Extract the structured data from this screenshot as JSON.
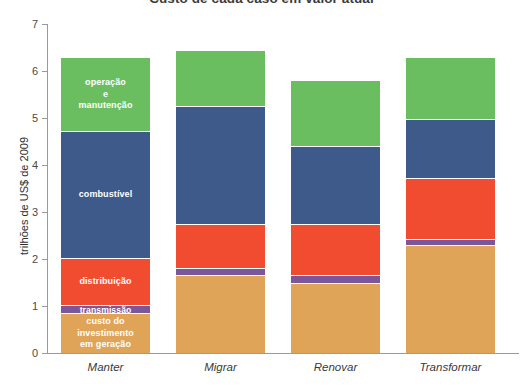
{
  "chart_data": {
    "type": "bar",
    "stacked": true,
    "title": "Custo de cada caso em valor atual",
    "xlabel": "",
    "ylabel": "trilhões de US$ de 2009",
    "ylim": [
      0,
      7
    ],
    "yticks": [
      0,
      1,
      2,
      3,
      4,
      5,
      6,
      7
    ],
    "ytick_labels": [
      "0",
      "1",
      "2",
      "3",
      "4",
      "5",
      "6",
      "7"
    ],
    "grid": false,
    "legend": "inline-labels-on-first-bar",
    "categories": [
      "Manter",
      "Migrar",
      "Renovar",
      "Transformar"
    ],
    "series": [
      {
        "name": "custo do investimento em geração",
        "label": "custo do\ninvestimento\nem geração",
        "color": "#E0A458",
        "values": [
          0.85,
          1.65,
          1.5,
          2.3
        ]
      },
      {
        "name": "transmissão",
        "label": "transmissão",
        "color": "#7B569B",
        "values": [
          0.17,
          0.15,
          0.15,
          0.12
        ]
      },
      {
        "name": "distribuição",
        "label": "distribuição",
        "color": "#F24C30",
        "values": [
          1.0,
          0.95,
          1.1,
          1.3
        ]
      },
      {
        "name": "combustível",
        "label": "combustível",
        "color": "#3D5A8A",
        "values": [
          2.7,
          2.5,
          1.65,
          1.25
        ],
        "totals_note": ""
      },
      {
        "name": "operação e manutenção",
        "label": "operação\ne\nmanutenção",
        "color": "#6BBE5F",
        "values": [
          1.58,
          1.2,
          1.4,
          1.33
        ]
      }
    ],
    "totals": [
      6.3,
      6.45,
      5.8,
      6.3
    ]
  },
  "colors": {
    "green": "#6BBE5F",
    "blue": "#3D5A8A",
    "red": "#F24C30",
    "purple": "#7B569B",
    "tan": "#E0A458",
    "axis": "#9a9a9a",
    "text": "#3a3a3a",
    "background": "#ffffff"
  }
}
